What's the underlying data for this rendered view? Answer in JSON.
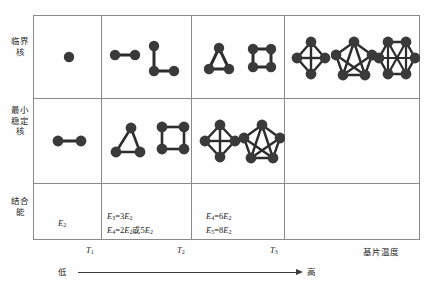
{
  "figure": {
    "row_labels": {
      "critical_nucleus": "临界核",
      "min_stable_nucleus": "最小稳定核",
      "binding_energy": "结合能"
    },
    "axis": {
      "ticks": [
        "T1",
        "T2",
        "T3"
      ],
      "tick_labels": [
        {
          "base": "T",
          "sub": "1"
        },
        {
          "base": "T",
          "sub": "2"
        },
        {
          "base": "T",
          "sub": "3"
        }
      ],
      "axis_title": "基片温度",
      "low_label": "低",
      "high_label": "高"
    },
    "energy_cells": [
      {
        "column": 1,
        "lines": [
          {
            "lhs_base": "E",
            "lhs_sub": "2",
            "rhs": ""
          }
        ],
        "text": "E2"
      },
      {
        "column": 2,
        "lines": [
          {
            "text_parts": [
              "E",
              "3",
              "=3",
              "E",
              "2"
            ]
          },
          {
            "text_parts": [
              "E",
              "4",
              "=2",
              "E",
              "2",
              "或5",
              "E",
              "2"
            ]
          }
        ],
        "text": "E3=3E2 ; E4=2E2或5E2"
      },
      {
        "column": 3,
        "lines": [
          {
            "text_parts": [
              "E",
              "4",
              "=6",
              "E",
              "2"
            ]
          },
          {
            "text_parts": [
              "E",
              "5",
              "=8",
              "E",
              "2"
            ]
          }
        ],
        "text": "E4=6E2 ; E5=8E2"
      },
      {
        "column": 4,
        "lines": [],
        "text": ""
      }
    ],
    "clusters": {
      "critical_row": [
        {
          "column": 1,
          "atoms": 1,
          "shape": "monomer"
        },
        {
          "column": 2,
          "atoms": 2,
          "shape": "dimer"
        },
        {
          "column": 2,
          "atoms": 3,
          "shape": "L-trimer"
        },
        {
          "column": 3,
          "atoms": 3,
          "shape": "triangle"
        },
        {
          "column": 3,
          "atoms": 4,
          "shape": "square"
        },
        {
          "column": 4,
          "atoms": 4,
          "shape": "rhombus-diagonals"
        },
        {
          "column": 4,
          "atoms": 5,
          "shape": "pentagon-diagonals"
        },
        {
          "column": 4,
          "atoms": 6,
          "shape": "hexagon-diagonals"
        }
      ],
      "stable_row": [
        {
          "column": 1,
          "atoms": 2,
          "shape": "dimer"
        },
        {
          "column": 2,
          "atoms": 3,
          "shape": "triangle"
        },
        {
          "column": 2,
          "atoms": 4,
          "shape": "square"
        },
        {
          "column": 3,
          "atoms": 4,
          "shape": "rhombus-diagonals"
        },
        {
          "column": 3,
          "atoms": 5,
          "shape": "pentagon-diagonals"
        }
      ]
    },
    "colors": {
      "atom": "#3a3a3a",
      "bond": "#2d2d2d",
      "grid_line": "#8a8a8a",
      "text": "#1d1d1d",
      "background": "#fefefe"
    }
  }
}
